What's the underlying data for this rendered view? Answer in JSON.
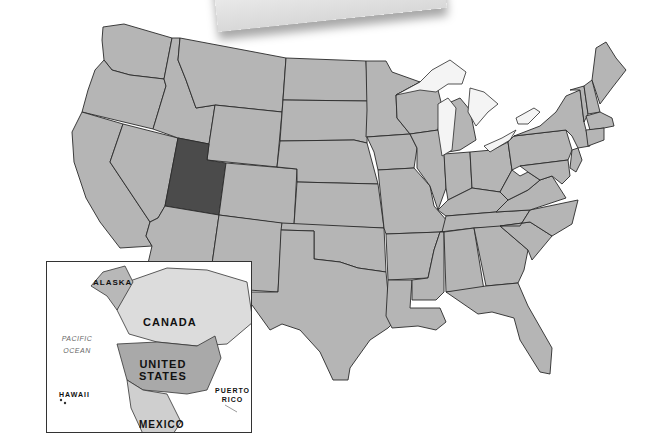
{
  "map": {
    "title": "United States map with highlighted state",
    "highlighted_state": "Utah",
    "colors": {
      "state_fill": "#b5b5b5",
      "highlight_fill": "#4b4b4b",
      "border": "#2a2a2a",
      "water": "#ffffff",
      "lakes": "#f4f4f4"
    }
  },
  "inset": {
    "labels": {
      "alaska": "ALASKA",
      "canada": "CANADA",
      "united_states_line1": "UNITED",
      "united_states_line2": "STATES",
      "hawaii": "HAWAII",
      "puerto_rico_line1": "PUERTO",
      "puerto_rico_line2": "RICO",
      "mexico": "MEXICO",
      "pacific_line1": "PACIFIC",
      "pacific_line2": "OCEAN"
    },
    "colors": {
      "us_fill": "#a9a9a9",
      "canada_fill": "#dcdcdc",
      "alaska_fill": "#b8b8b8",
      "mexico_fill": "#cfcfcf"
    }
  }
}
